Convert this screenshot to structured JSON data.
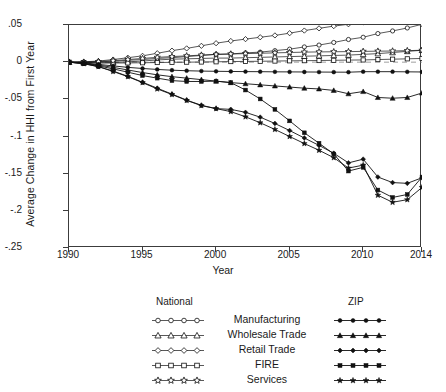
{
  "axes": {
    "ylabel": "Average Change in HHI from First Year",
    "xlabel": "Year",
    "yticks": [
      ".05",
      "0",
      "-.05",
      "-.1",
      "-.15",
      "-.2",
      "-.25"
    ],
    "xticks": [
      "1990",
      "1995",
      "2000",
      "2005",
      "2010",
      "2014"
    ]
  },
  "legend": {
    "header_national": "National",
    "header_zip": "ZIP",
    "rows": [
      {
        "label": "Manufacturing",
        "national_marker": "circle",
        "zip_marker": "circle"
      },
      {
        "label": "Wholesale Trade",
        "national_marker": "triangle",
        "zip_marker": "triangle"
      },
      {
        "label": "Retail Trade",
        "national_marker": "diamond",
        "zip_marker": "diamond"
      },
      {
        "label": "FIRE",
        "national_marker": "square",
        "zip_marker": "square"
      },
      {
        "label": "Services",
        "national_marker": "star",
        "zip_marker": "star"
      }
    ]
  },
  "chart_data": {
    "type": "line",
    "title": "",
    "xlabel": "Year",
    "ylabel": "Average Change in HHI from First Year",
    "xlim": [
      1990,
      2014
    ],
    "ylim": [
      -0.25,
      0.05
    ],
    "grid": false,
    "legend_position": "below-plot",
    "zeroline": true,
    "x": [
      1990,
      1991,
      1992,
      1993,
      1994,
      1995,
      1996,
      1997,
      1998,
      1999,
      2000,
      2001,
      2002,
      2003,
      2004,
      2005,
      2006,
      2007,
      2008,
      2009,
      2010,
      2011,
      2012,
      2013,
      2014
    ],
    "series": [
      {
        "name": "National Manufacturing",
        "group": "National",
        "industry": "Manufacturing",
        "marker": "circle",
        "filled": false,
        "values": [
          0,
          0,
          0.0005,
          0.0012,
          0.0025,
          0.0035,
          0.005,
          0.006,
          0.0075,
          0.009,
          0.0105,
          0.011,
          0.0125,
          0.0135,
          0.0155,
          0.0175,
          0.0205,
          0.023,
          0.0265,
          0.0305,
          0.0335,
          0.0385,
          0.042,
          0.046,
          0.051
        ]
      },
      {
        "name": "National Wholesale Trade",
        "group": "National",
        "industry": "Wholesale Trade",
        "marker": "triangle",
        "filled": false,
        "values": [
          0,
          -0.0005,
          -0.0008,
          -0.0005,
          0.0005,
          0.0015,
          0.003,
          0.004,
          0.0045,
          0.005,
          0.0055,
          0.0055,
          0.006,
          0.0065,
          0.007,
          0.0075,
          0.008,
          0.0085,
          0.009,
          0.0095,
          0.0105,
          0.0115,
          0.013,
          0.0145,
          0.016
        ]
      },
      {
        "name": "National Retail Trade",
        "group": "National",
        "industry": "Retail Trade",
        "marker": "diamond",
        "filled": false,
        "values": [
          0,
          0.0005,
          0.0015,
          0.0035,
          0.006,
          0.0085,
          0.012,
          0.0155,
          0.0185,
          0.022,
          0.0255,
          0.0285,
          0.031,
          0.0335,
          0.036,
          0.039,
          0.0425,
          0.0455,
          0.0485,
          0.051,
          0.0535,
          0.0565,
          0.058,
          0.059,
          0.0605
        ]
      },
      {
        "name": "National FIRE",
        "group": "National",
        "industry": "FIRE",
        "marker": "square",
        "filled": false,
        "values": [
          0,
          -0.0005,
          -0.001,
          -0.0012,
          -0.001,
          -0.0008,
          -0.0005,
          -0.0002,
          0,
          0.0002,
          0.0005,
          0.0008,
          0.001,
          0.0012,
          0.0015,
          0.0018,
          0.002,
          0.0022,
          0.0025,
          0.0028,
          0.003,
          0.0035,
          0.004,
          0.0045,
          0.005
        ]
      },
      {
        "name": "National Services",
        "group": "National",
        "industry": "Services",
        "marker": "star",
        "filled": false,
        "values": [
          0,
          0,
          0.0008,
          0.002,
          0.0035,
          0.005,
          0.0065,
          0.0075,
          0.0085,
          0.0095,
          0.0105,
          0.011,
          0.0115,
          0.012,
          0.0125,
          0.013,
          0.0135,
          0.0138,
          0.014,
          0.0142,
          0.0145,
          0.0148,
          0.015,
          0.0155,
          0.016
        ]
      },
      {
        "name": "ZIP Manufacturing",
        "group": "ZIP",
        "industry": "Manufacturing",
        "marker": "circle",
        "filled": true,
        "values": [
          0,
          -0.001,
          -0.003,
          -0.005,
          -0.007,
          -0.0085,
          -0.0098,
          -0.0108,
          -0.0115,
          -0.012,
          -0.0123,
          -0.0125,
          -0.0127,
          -0.0128,
          -0.013,
          -0.0131,
          -0.0132,
          -0.0133,
          -0.0134,
          -0.0135,
          -0.0128,
          -0.0128,
          -0.0128,
          -0.013,
          -0.0132
        ]
      },
      {
        "name": "ZIP Wholesale Trade",
        "group": "ZIP",
        "industry": "Wholesale Trade",
        "marker": "triangle",
        "filled": true,
        "values": [
          0,
          -0.0015,
          -0.004,
          -0.007,
          -0.0105,
          -0.014,
          -0.017,
          -0.0195,
          -0.0215,
          -0.0235,
          -0.0255,
          -0.0275,
          -0.029,
          -0.0305,
          -0.032,
          -0.0335,
          -0.035,
          -0.036,
          -0.038,
          -0.0425,
          -0.0395,
          -0.0475,
          -0.0485,
          -0.0475,
          -0.0415
        ]
      },
      {
        "name": "ZIP Retail Trade",
        "group": "ZIP",
        "industry": "Retail Trade",
        "marker": "diamond",
        "filled": true,
        "values": [
          0,
          -0.002,
          -0.006,
          -0.012,
          -0.019,
          -0.027,
          -0.035,
          -0.043,
          -0.051,
          -0.058,
          -0.0625,
          -0.0635,
          -0.0675,
          -0.074,
          -0.0825,
          -0.092,
          -0.102,
          -0.112,
          -0.1225,
          -0.1355,
          -0.1305,
          -0.1545,
          -0.162,
          -0.163,
          -0.1555
        ]
      },
      {
        "name": "ZIP FIRE",
        "group": "ZIP",
        "industry": "FIRE",
        "marker": "square",
        "filled": true,
        "values": [
          0,
          -0.0015,
          -0.005,
          -0.009,
          -0.0135,
          -0.018,
          -0.0215,
          -0.0248,
          -0.026,
          -0.026,
          -0.0255,
          -0.0275,
          -0.0375,
          -0.0495,
          -0.0635,
          -0.079,
          -0.095,
          -0.109,
          -0.1235,
          -0.1465,
          -0.1415,
          -0.172,
          -0.182,
          -0.178,
          -0.1545
        ]
      },
      {
        "name": "ZIP Services",
        "group": "ZIP",
        "industry": "Services",
        "marker": "star",
        "filled": true,
        "values": [
          0,
          -0.002,
          -0.006,
          -0.0125,
          -0.0195,
          -0.0275,
          -0.036,
          -0.0435,
          -0.0515,
          -0.0585,
          -0.0625,
          -0.0665,
          -0.0735,
          -0.0815,
          -0.0905,
          -0.1,
          -0.1095,
          -0.1185,
          -0.1285,
          -0.1425,
          -0.1385,
          -0.179,
          -0.1885,
          -0.185,
          -0.1685
        ]
      }
    ]
  }
}
